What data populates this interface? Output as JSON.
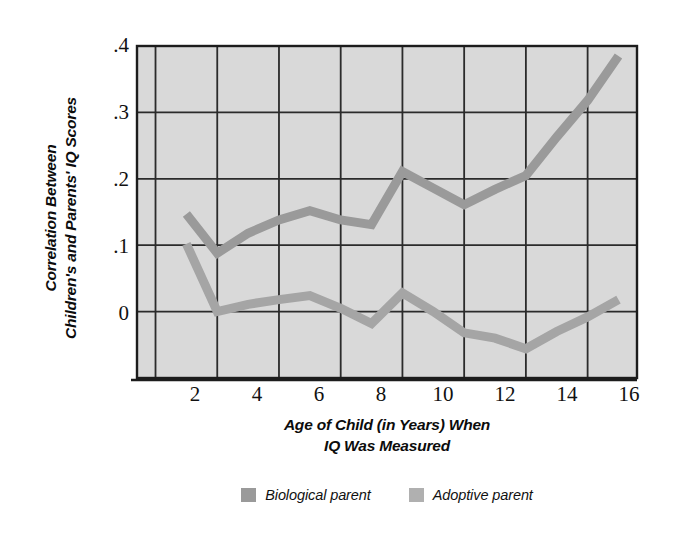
{
  "chart_data": {
    "type": "line",
    "title": "",
    "subtitle": "",
    "xlabel_lines": [
      "Age of Child (in Years) When",
      "IQ Was Measured"
    ],
    "ylabel_lines": [
      "Correlation Between",
      "Children's and Parents' IQ Scores"
    ],
    "xlabel": "Age of Child (in Years) When IQ Was Measured",
    "ylabel": "Correlation Between Children's and Parents' IQ Scores",
    "xlim": [
      1.4,
      17.6
    ],
    "ylim": [
      -0.1,
      0.4
    ],
    "xticks": [
      2,
      4,
      6,
      8,
      10,
      12,
      14,
      16
    ],
    "xtick_labels": [
      "2",
      "4",
      "6",
      "8",
      "10",
      "12",
      "14",
      "16"
    ],
    "yticks": [
      0,
      0.1,
      0.2,
      0.3,
      0.4
    ],
    "ytick_labels": [
      "0",
      ".1",
      ".2",
      ".3",
      ".4"
    ],
    "grid": true,
    "grid_color": "#2b2b2b",
    "plot_bg": "#dcdcdc",
    "legend_position": "bottom-center",
    "x": [
      3,
      4,
      5,
      6,
      7,
      8,
      9,
      10,
      11,
      12,
      13,
      14,
      15,
      16,
      17
    ],
    "series": [
      {
        "name": "Biological parent",
        "color": "#9a9a9a",
        "values": [
          0.147,
          0.088,
          0.118,
          0.138,
          0.152,
          0.138,
          0.131,
          0.211,
          0.186,
          0.161,
          0.184,
          0.205,
          0.263,
          0.318,
          0.385
        ]
      },
      {
        "name": "Adoptive parent",
        "color": "#a5a5a5",
        "values": [
          0.102,
          0.0,
          0.011,
          0.018,
          0.024,
          0.005,
          -0.018,
          0.028,
          0.0,
          -0.032,
          -0.04,
          -0.056,
          -0.03,
          -0.008,
          0.018
        ]
      }
    ]
  },
  "legend": {
    "items": [
      {
        "label": "Biological parent",
        "color": "#9a9a9a"
      },
      {
        "label": "Adoptive parent",
        "color": "#b0b0b0"
      }
    ]
  },
  "axes": {
    "y_title_line1": "Correlation Between",
    "y_title_line2": "Children's and Parents' IQ Scores",
    "x_title_line1": "Age of Child (in Years) When",
    "x_title_line2": "IQ Was Measured"
  }
}
